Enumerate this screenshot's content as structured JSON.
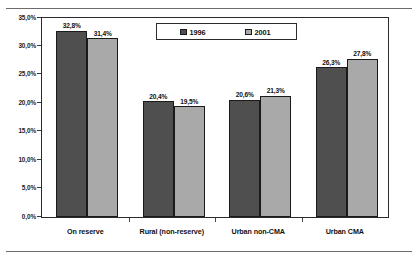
{
  "chart_data": {
    "type": "bar",
    "title": "",
    "subtitle": "",
    "xlabel": "",
    "ylabel": "",
    "categories": [
      "On reserve",
      "Rural (non-reserve)",
      "Urban non-CMA",
      "Urban CMA"
    ],
    "series": [
      {
        "name": "1996",
        "color": "#4f4f4f",
        "values": [
          32.8,
          20.4,
          20.6,
          26.3
        ],
        "labels": [
          "32,8%",
          "20,4%",
          "20,6%",
          "26,3%"
        ]
      },
      {
        "name": "2001",
        "color": "#a9a9a9",
        "values": [
          31.4,
          19.5,
          21.3,
          27.8
        ],
        "labels": [
          "31,4%",
          "19,5%",
          "21,3%",
          "27,8%"
        ]
      }
    ],
    "ylim": [
      0,
      35
    ],
    "ytick_values": [
      0,
      5,
      10,
      15,
      20,
      25,
      30,
      35
    ],
    "ytick_labels": [
      "0,0%",
      "5,0%",
      "10,0%",
      "15,0%",
      "20,0%",
      "25,0%",
      "30,0%",
      "35,0%"
    ],
    "grid": false,
    "legend_position": "top-center",
    "legend_entries": [
      "1996",
      "2001"
    ],
    "decimal_separator": ","
  },
  "legend": {
    "entry_1996": "1996",
    "entry_2001": "2001"
  }
}
